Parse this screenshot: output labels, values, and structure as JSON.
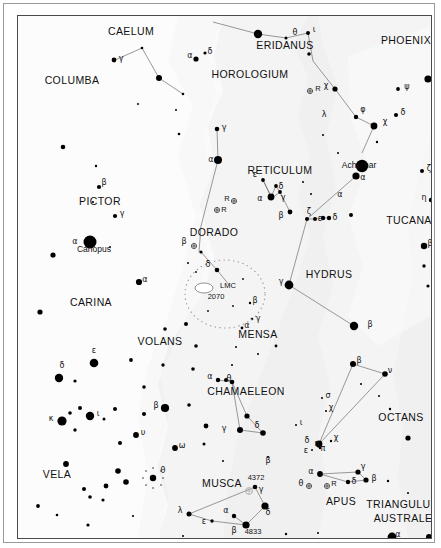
{
  "meta": {
    "background": "#f5f5f5",
    "milky_way_color": "#ffffff",
    "star_color": "#000000",
    "line_color": "#6e6e6e"
  },
  "constellations": [
    {
      "name": "CAELUM",
      "x": 113,
      "y": 19,
      "size": "normal"
    },
    {
      "name": "COLUMBA",
      "x": 54,
      "y": 68,
      "size": "normal"
    },
    {
      "name": "HOROLOGIUM",
      "x": 232,
      "y": 62,
      "size": "normal"
    },
    {
      "name": "ERIDANUS",
      "x": 267,
      "y": 33,
      "size": "normal"
    },
    {
      "name": "PHOENIX",
      "x": 388,
      "y": 28,
      "size": "normal"
    },
    {
      "name": "RETICULUM",
      "x": 262,
      "y": 158,
      "size": "normal"
    },
    {
      "name": "PICTOR",
      "x": 82,
      "y": 189,
      "size": "normal"
    },
    {
      "name": "DORADO",
      "x": 196,
      "y": 220,
      "size": "normal"
    },
    {
      "name": "TUCANA",
      "x": 391,
      "y": 208,
      "size": "normal"
    },
    {
      "name": "HYDRUS",
      "x": 311,
      "y": 262,
      "size": "normal"
    },
    {
      "name": "CARINA",
      "x": 73,
      "y": 290,
      "size": "normal"
    },
    {
      "name": "MENSA",
      "x": 240,
      "y": 322,
      "size": "normal"
    },
    {
      "name": "VOLANS",
      "x": 142,
      "y": 329,
      "size": "normal"
    },
    {
      "name": "CHAMAELEON",
      "x": 228,
      "y": 379,
      "size": "normal"
    },
    {
      "name": "OCTANS",
      "x": 383,
      "y": 405,
      "size": "normal"
    },
    {
      "name": "VELA",
      "x": 39,
      "y": 462,
      "size": "normal"
    },
    {
      "name": "MUSCA",
      "x": 204,
      "y": 471,
      "size": "normal"
    },
    {
      "name": "APUS",
      "x": 323,
      "y": 489,
      "size": "normal"
    },
    {
      "name": "TRIANGULUM",
      "x": 385,
      "y": 492,
      "size": "normal"
    },
    {
      "name": "AUSTRALE",
      "x": 385,
      "y": 506,
      "size": "normal"
    }
  ],
  "named_stars": [
    {
      "name": "Canopus",
      "x": 76,
      "y": 236
    },
    {
      "name": "Achernar",
      "x": 341,
      "y": 152
    }
  ],
  "deep_sky": [
    {
      "label": "LMC",
      "x": 210,
      "y": 272
    },
    {
      "label": "2070",
      "x": 198,
      "y": 283
    },
    {
      "label": "4372",
      "x": 238,
      "y": 464
    },
    {
      "label": "4833",
      "x": 235,
      "y": 518
    }
  ],
  "greek_labels": [
    {
      "g": "γ",
      "x": 103,
      "y": 45
    },
    {
      "g": "α",
      "x": 172,
      "y": 42
    },
    {
      "g": "δ",
      "x": 192,
      "y": 38
    },
    {
      "g": "θ",
      "x": 277,
      "y": 19
    },
    {
      "g": "ι",
      "x": 296,
      "y": 16
    },
    {
      "g": "ψ",
      "x": 389,
      "y": 73
    },
    {
      "g": "χ",
      "x": 308,
      "y": 72
    },
    {
      "g": "φ",
      "x": 345,
      "y": 96
    },
    {
      "g": "χ",
      "x": 367,
      "y": 108
    },
    {
      "g": "δ",
      "x": 385,
      "y": 99
    },
    {
      "g": "λ",
      "x": 306,
      "y": 101
    },
    {
      "g": "γ",
      "x": 206,
      "y": 114
    },
    {
      "g": "α",
      "x": 193,
      "y": 146
    },
    {
      "g": "ζ",
      "x": 411,
      "y": 155
    },
    {
      "g": "η",
      "x": 406,
      "y": 184
    },
    {
      "g": "α",
      "x": 345,
      "y": 164
    },
    {
      "g": "α",
      "x": 322,
      "y": 181
    },
    {
      "g": "ε",
      "x": 237,
      "y": 161
    },
    {
      "g": "δ",
      "x": 263,
      "y": 173
    },
    {
      "g": "γ",
      "x": 265,
      "y": 184
    },
    {
      "g": "α",
      "x": 242,
      "y": 185
    },
    {
      "g": "β",
      "x": 263,
      "y": 202
    },
    {
      "g": "β",
      "x": 86,
      "y": 169
    },
    {
      "g": "γ",
      "x": 104,
      "y": 200
    },
    {
      "g": "α",
      "x": 57,
      "y": 228
    },
    {
      "g": "β",
      "x": 166,
      "y": 228
    },
    {
      "g": "δ",
      "x": 190,
      "y": 251
    },
    {
      "g": "β",
      "x": 412,
      "y": 230
    },
    {
      "g": "γ",
      "x": 263,
      "y": 268
    },
    {
      "g": "ζ",
      "x": 291,
      "y": 198
    },
    {
      "g": "ε",
      "x": 302,
      "y": 205
    },
    {
      "g": "δ",
      "x": 317,
      "y": 204
    },
    {
      "g": "β",
      "x": 352,
      "y": 311
    },
    {
      "g": "α",
      "x": 127,
      "y": 266
    },
    {
      "g": "β",
      "x": 237,
      "y": 287
    },
    {
      "g": "γ",
      "x": 240,
      "y": 305
    },
    {
      "g": "α",
      "x": 229,
      "y": 312
    },
    {
      "g": "ε",
      "x": 76,
      "y": 337
    },
    {
      "g": "δ",
      "x": 44,
      "y": 352
    },
    {
      "g": "κ",
      "x": 33,
      "y": 405
    },
    {
      "g": "ι",
      "x": 80,
      "y": 400
    },
    {
      "g": "β",
      "x": 138,
      "y": 392
    },
    {
      "g": "υ",
      "x": 125,
      "y": 419
    },
    {
      "g": "ω",
      "x": 164,
      "y": 432
    },
    {
      "g": "θ",
      "x": 145,
      "y": 457
    },
    {
      "g": "α",
      "x": 192,
      "y": 363
    },
    {
      "g": "θ",
      "x": 211,
      "y": 365
    },
    {
      "g": "γ",
      "x": 206,
      "y": 415
    },
    {
      "g": "δ",
      "x": 239,
      "y": 412
    },
    {
      "g": "β",
      "x": 250,
      "y": 447
    },
    {
      "g": "λ",
      "x": 162,
      "y": 497
    },
    {
      "g": "ε",
      "x": 186,
      "y": 508
    },
    {
      "g": "α",
      "x": 208,
      "y": 497
    },
    {
      "g": "β",
      "x": 216,
      "y": 517
    },
    {
      "g": "γ",
      "x": 243,
      "y": 476
    },
    {
      "g": "δ",
      "x": 250,
      "y": 499
    },
    {
      "g": "σ",
      "x": 310,
      "y": 382
    },
    {
      "g": "χ",
      "x": 313,
      "y": 394
    },
    {
      "g": "ι",
      "x": 283,
      "y": 409
    },
    {
      "g": "δ",
      "x": 289,
      "y": 427
    },
    {
      "g": "χ",
      "x": 318,
      "y": 424
    },
    {
      "g": "π",
      "x": 305,
      "y": 435
    },
    {
      "g": "η",
      "x": 299,
      "y": 430
    },
    {
      "g": "ε",
      "x": 288,
      "y": 437
    },
    {
      "g": "α",
      "x": 293,
      "y": 458
    },
    {
      "g": "θ",
      "x": 283,
      "y": 470
    },
    {
      "g": "γ",
      "x": 345,
      "y": 453
    },
    {
      "g": "δ",
      "x": 336,
      "y": 468
    },
    {
      "g": "β",
      "x": 356,
      "y": 465
    },
    {
      "g": "β",
      "x": 341,
      "y": 347
    },
    {
      "g": "ν",
      "x": 372,
      "y": 357
    },
    {
      "g": "α",
      "x": 380,
      "y": 521
    }
  ],
  "variable_labels": [
    {
      "label": "R",
      "x": 300,
      "y": 75
    },
    {
      "label": "R",
      "x": 209,
      "y": 185
    },
    {
      "label": "R",
      "x": 206,
      "y": 196
    },
    {
      "label": "R",
      "x": 316,
      "y": 470
    }
  ]
}
